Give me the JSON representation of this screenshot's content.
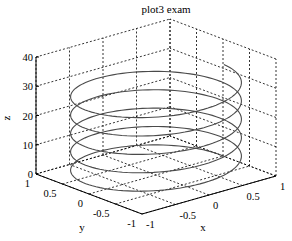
{
  "chart_data": {
    "type": "line3d",
    "title": "plot3 exam",
    "xlabel": "x",
    "ylabel": "y",
    "zlabel": "z",
    "xlim": [
      -1,
      1
    ],
    "ylim": [
      -1,
      1
    ],
    "zlim": [
      0,
      40
    ],
    "xticks": [
      "-1",
      "-0.5",
      "0",
      "0.5",
      "1"
    ],
    "yticks": [
      "-1",
      "-0.5",
      "0",
      "0.5",
      "1"
    ],
    "zticks": [
      "0",
      "10",
      "20",
      "30",
      "40"
    ],
    "grid": true,
    "series": [
      {
        "name": "helix",
        "x": "cos(t)",
        "y": "sin(t)",
        "z": "t",
        "t_range": [
          0,
          31.4159
        ],
        "t_step": 0.0628,
        "color": "#4a4a4a"
      }
    ]
  }
}
